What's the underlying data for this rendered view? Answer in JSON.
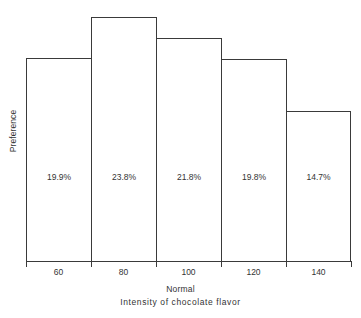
{
  "chart_data": {
    "type": "bar",
    "title": "",
    "categories": [
      "60",
      "80",
      "100",
      "120",
      "140"
    ],
    "values": [
      19.9,
      23.8,
      21.8,
      19.8,
      14.7
    ],
    "data_labels": [
      "19.9%",
      "23.8%",
      "21.8%",
      "19.8%",
      "14.7%"
    ],
    "xlabel": "Intensity of chocolate flavor",
    "ylabel": "Preference",
    "x_axis_annotation": "Normal",
    "ylim": [
      0,
      25.5
    ],
    "grid": false,
    "legend": null,
    "bar_fill": "#ffffff",
    "bar_stroke": "#3a3a3a",
    "background": "#ffffff",
    "text_color": "#333333"
  }
}
